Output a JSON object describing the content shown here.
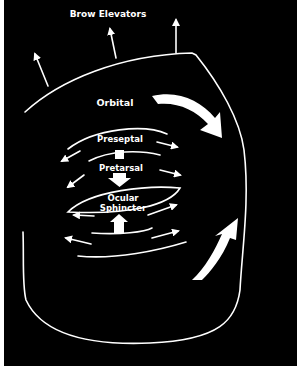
{
  "diagram": {
    "title": "Brow Elevators",
    "labels": {
      "brow_elevators": "Brow Elevators",
      "orbital": "Orbital",
      "preseptal": "Preseptal",
      "pretarsal": "Pretarsal",
      "ocular_sphincter_line1": "Ocular",
      "ocular_sphincter_line2": "Sphincter"
    },
    "colors": {
      "background": "#000000",
      "foreground": "#ffffff",
      "page": "#ffffff"
    }
  }
}
